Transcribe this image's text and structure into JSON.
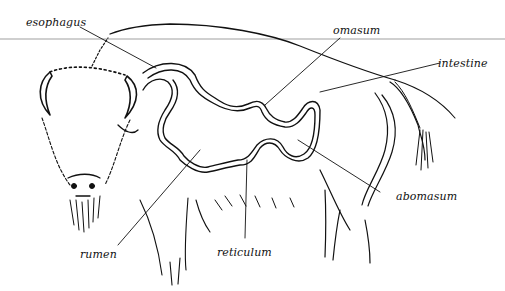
{
  "diagram": {
    "labels": [
      {
        "id": "esophagus",
        "text": "esophagus"
      },
      {
        "id": "omasum",
        "text": "omasum"
      },
      {
        "id": "intestine",
        "text": "intestine"
      },
      {
        "id": "abomasum",
        "text": "abomasum"
      },
      {
        "id": "rumen",
        "text": "rumen"
      },
      {
        "id": "reticulum",
        "text": "reticulum"
      }
    ],
    "colors": {
      "line": "#111111",
      "rule": "#cfcfcf",
      "background": "#ffffff"
    }
  }
}
